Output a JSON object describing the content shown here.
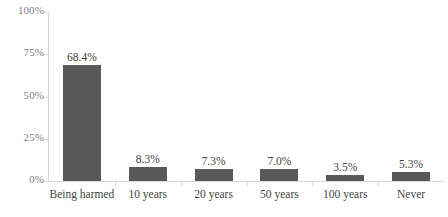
{
  "chart_data": {
    "type": "bar",
    "title": "",
    "xlabel": "",
    "ylabel": "",
    "categories": [
      "Being harmed",
      "10 years",
      "20 years",
      "50 years",
      "100 years",
      "Never"
    ],
    "values": [
      68.4,
      8.3,
      7.3,
      7.0,
      3.5,
      5.3
    ],
    "value_labels": [
      "68.4%",
      "8.3%",
      "7.3%",
      "7.0%",
      "3.5%",
      "5.3%"
    ],
    "ylim": [
      0,
      100
    ],
    "y_ticks": [
      0,
      25,
      50,
      75,
      100
    ],
    "y_tick_labels": [
      "0%",
      "25%",
      "50%",
      "75%",
      "100%"
    ],
    "grid": false,
    "legend": "none",
    "bar_color": "#595959",
    "axis_color": "#d9d9d9",
    "tick_label_color": "#808080",
    "data_label_color": "#3f3f3f"
  }
}
